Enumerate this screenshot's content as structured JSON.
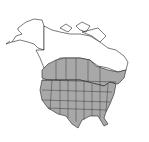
{
  "map": {
    "type": "species-range-map",
    "region": "North America",
    "legend": {
      "range_fill": "#a8a8a8",
      "outside_fill": "#ffffff",
      "border_color": "#222222"
    },
    "range_description": "Contiguous United States and southern Canada",
    "alt": "Range map of North America with shaded distribution"
  }
}
